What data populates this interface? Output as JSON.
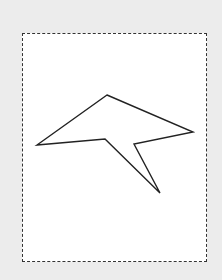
{
  "canvas": {
    "background": "#ececec",
    "frame": {
      "style": "dashed",
      "border_color": "#333333",
      "fill": "#ffffff"
    }
  },
  "shape": {
    "type": "polygon",
    "stroke": "#222222",
    "fill": "none",
    "points": "107,95 193,132 134,144 160,193 105,139 37,145"
  }
}
